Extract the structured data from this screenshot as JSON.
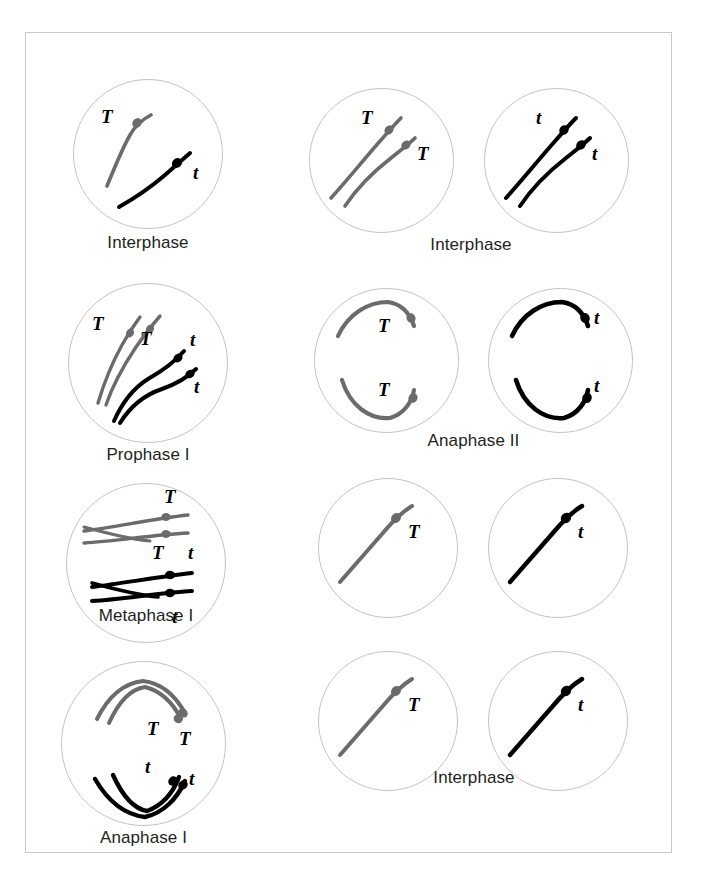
{
  "figure": {
    "border_color": "#c9c9c9",
    "background": "#ffffff",
    "chromosome_colors": {
      "dominant_T": "#6b6b6b",
      "recessive_t": "#000000"
    },
    "cell_outline_color": "#c4c4c4"
  },
  "labels": {
    "interphase": "Interphase",
    "prophase_1": "Prophase I",
    "metaphase_1": "Metaphase I",
    "anaphase_1": "Anaphase I",
    "interphase_2": "Interphase",
    "anaphase_2": "Anaphase II",
    "interphase_final": "Interphase"
  },
  "alleles": {
    "dominant": "T",
    "recessive": "t"
  },
  "left_column": [
    {
      "id": "left-interphase",
      "stage": "Interphase",
      "cells": 1,
      "chromosomes": [
        {
          "allele": "T",
          "color": "#6b6b6b",
          "duplicated": false
        },
        {
          "allele": "t",
          "color": "#000000",
          "duplicated": false
        }
      ],
      "allele_markers": [
        "T",
        "t"
      ]
    },
    {
      "id": "left-prophase-1",
      "stage": "Prophase I",
      "cells": 1,
      "chromosomes": [
        {
          "allele": "T",
          "color": "#6b6b6b",
          "duplicated": true
        },
        {
          "allele": "t",
          "color": "#000000",
          "duplicated": true
        }
      ],
      "allele_markers": [
        "T",
        "T",
        "t",
        "t"
      ]
    },
    {
      "id": "left-metaphase-1",
      "stage": "Metaphase I",
      "cells": 1,
      "chromosomes": [
        {
          "allele": "T",
          "color": "#6b6b6b",
          "duplicated": true
        },
        {
          "allele": "t",
          "color": "#000000",
          "duplicated": true
        }
      ],
      "allele_markers": [
        "T",
        "T",
        "t",
        "t"
      ]
    },
    {
      "id": "left-anaphase-1",
      "stage": "Anaphase I",
      "cells": 1,
      "chromosomes": [
        {
          "allele": "T",
          "color": "#6b6b6b",
          "duplicated": true
        },
        {
          "allele": "t",
          "color": "#000000",
          "duplicated": true
        }
      ],
      "allele_markers": [
        "T",
        "T",
        "t",
        "t"
      ]
    }
  ],
  "right_column": [
    {
      "id": "right-interphase",
      "stage": "Interphase",
      "cells": 2,
      "cell_contents": [
        {
          "allele": "T",
          "color": "#6b6b6b",
          "count": 2,
          "allele_markers": [
            "T",
            "T"
          ]
        },
        {
          "allele": "t",
          "color": "#000000",
          "count": 2,
          "allele_markers": [
            "t",
            "t"
          ]
        }
      ]
    },
    {
      "id": "right-anaphase-2",
      "stage": "Anaphase II",
      "cells": 2,
      "cell_contents": [
        {
          "allele": "T",
          "color": "#6b6b6b",
          "count": 2,
          "allele_markers": [
            "T",
            "T"
          ]
        },
        {
          "allele": "t",
          "color": "#000000",
          "count": 2,
          "allele_markers": [
            "t",
            "t"
          ]
        }
      ]
    },
    {
      "id": "right-interphase-final",
      "stage": "Interphase",
      "cells": 4,
      "cell_contents": [
        {
          "allele": "T",
          "color": "#6b6b6b",
          "count": 1,
          "allele_markers": [
            "T"
          ]
        },
        {
          "allele": "t",
          "color": "#000000",
          "count": 1,
          "allele_markers": [
            "t"
          ]
        },
        {
          "allele": "T",
          "color": "#6b6b6b",
          "count": 1,
          "allele_markers": [
            "T"
          ]
        },
        {
          "allele": "t",
          "color": "#000000",
          "count": 1,
          "allele_markers": [
            "t"
          ]
        }
      ]
    }
  ]
}
